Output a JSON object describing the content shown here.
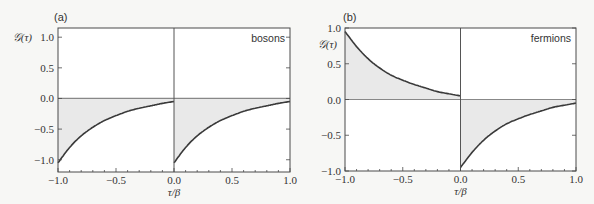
{
  "chart_data": [
    {
      "type": "line",
      "panel_label": "(a)",
      "annotation": "bosons",
      "annotation_placement": "top-right",
      "xlabel": "τ/β",
      "ylabel": "𝒢(τ)",
      "xlim": [
        -1.0,
        1.0
      ],
      "ylim": [
        -1.2,
        1.15
      ],
      "x_ticks": [
        -1.0,
        -0.5,
        0.0,
        0.5,
        1.0
      ],
      "x_tick_labels": [
        "−1.0",
        "−0.5",
        "0.0",
        "0.5",
        "1.0"
      ],
      "y_ticks": [
        -1.0,
        -0.5,
        0.0,
        0.5,
        1.0
      ],
      "y_tick_labels": [
        "−1.0",
        "−0.5",
        "0.0",
        "0.5",
        "1.0"
      ],
      "series": [
        {
          "name": "G negative tau",
          "x": [
            -1.0,
            -0.9,
            -0.8,
            -0.7,
            -0.6,
            -0.5,
            -0.4,
            -0.3,
            -0.2,
            -0.1,
            0.0
          ],
          "y": [
            -1.05,
            -0.8,
            -0.61,
            -0.47,
            -0.36,
            -0.28,
            -0.21,
            -0.16,
            -0.12,
            -0.08,
            -0.05
          ]
        },
        {
          "name": "G positive tau",
          "x": [
            0.0,
            0.1,
            0.2,
            0.3,
            0.4,
            0.5,
            0.6,
            0.7,
            0.8,
            0.9,
            1.0
          ],
          "y": [
            -1.05,
            -0.8,
            -0.61,
            -0.47,
            -0.36,
            -0.28,
            -0.21,
            -0.16,
            -0.12,
            -0.08,
            -0.05
          ]
        }
      ],
      "fill_to_zero": true,
      "grid": false
    },
    {
      "type": "line",
      "panel_label": "(b)",
      "annotation": "fermions",
      "annotation_placement": "top-right",
      "xlabel": "τ/β",
      "ylabel": "𝒢(τ)",
      "xlim": [
        -1.0,
        1.0
      ],
      "ylim": [
        -1.0,
        1.0
      ],
      "x_ticks": [
        -1.0,
        -0.5,
        0.0,
        0.5,
        1.0
      ],
      "x_tick_labels": [
        "−1.0",
        "−0.5",
        "0.0",
        "0.5",
        "1.0"
      ],
      "y_ticks": [
        -1.0,
        -0.5,
        0.0,
        0.5,
        1.0
      ],
      "y_tick_labels": [
        "−1.0",
        "−0.5",
        "0.0",
        "0.5",
        "1.0"
      ],
      "series": [
        {
          "name": "G negative tau",
          "x": [
            -1.0,
            -0.9,
            -0.8,
            -0.7,
            -0.6,
            -0.5,
            -0.4,
            -0.3,
            -0.2,
            -0.1,
            0.0
          ],
          "y": [
            0.95,
            0.74,
            0.57,
            0.44,
            0.34,
            0.27,
            0.21,
            0.16,
            0.11,
            0.08,
            0.05
          ]
        },
        {
          "name": "G positive tau",
          "x": [
            0.0,
            0.1,
            0.2,
            0.3,
            0.4,
            0.5,
            0.6,
            0.7,
            0.8,
            0.9,
            1.0
          ],
          "y": [
            -0.95,
            -0.74,
            -0.57,
            -0.44,
            -0.34,
            -0.27,
            -0.21,
            -0.16,
            -0.11,
            -0.08,
            -0.05
          ]
        }
      ],
      "fill_to_zero": true,
      "grid": false
    }
  ],
  "colors": {
    "curve": "#3a3a3a",
    "fill": "#e9e9e9",
    "frame": "#4a4a4a",
    "background": "#ffffff"
  }
}
